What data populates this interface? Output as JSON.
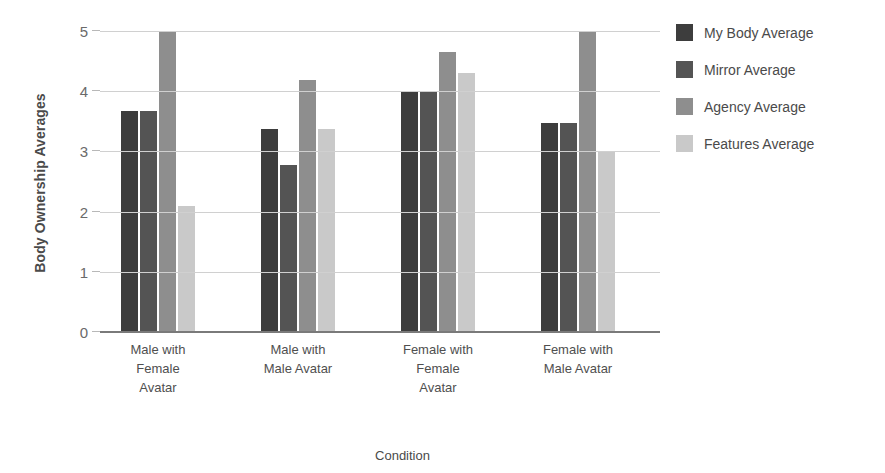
{
  "chart_data": {
    "type": "bar",
    "title": "",
    "xlabel": "Condition",
    "ylabel": "Body Ownership Averages",
    "categories": [
      "Male with\nFemale\nAvatar",
      "Male with\nMale Avatar",
      "Female with\nFemale\nAvatar",
      "Female with\nMale Avatar"
    ],
    "category_lines": [
      [
        "Male with",
        "Female",
        "Avatar"
      ],
      [
        "Male with",
        "Male Avatar"
      ],
      [
        "Female with",
        "Female",
        "Avatar"
      ],
      [
        "Female with",
        "Male Avatar"
      ]
    ],
    "series": [
      {
        "name": "My Body Average",
        "color": "#3d3d3d",
        "values": [
          3.67,
          3.37,
          4.0,
          3.48
        ]
      },
      {
        "name": "Mirror Average",
        "color": "#545454",
        "values": [
          3.67,
          2.77,
          4.0,
          3.48
        ]
      },
      {
        "name": "Agency Average",
        "color": "#8e8e8e",
        "values": [
          5.0,
          4.18,
          4.65,
          5.0
        ]
      },
      {
        "name": "Features Average",
        "color": "#c9c9c9",
        "values": [
          2.1,
          3.37,
          4.3,
          3.0
        ]
      }
    ],
    "ylim": [
      0,
      5
    ],
    "yticks": [
      "0",
      "1",
      "2",
      "3",
      "4",
      "5"
    ],
    "grid": true,
    "legend_position": "right",
    "gridline_color": "#d0d0d0",
    "axis_color": "#7a7a7a"
  }
}
